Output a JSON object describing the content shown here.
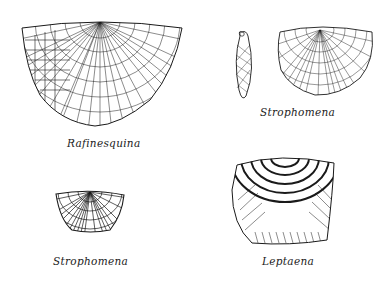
{
  "figures": [
    {
      "id": "rafinesquina",
      "label": "Rafinesquina"
    },
    {
      "id": "strophomena-top",
      "label": "Strophomena"
    },
    {
      "id": "strophomena-bottom",
      "label": "Strophomena"
    },
    {
      "id": "leptaena",
      "label": "Leptaena"
    }
  ],
  "colors": {
    "ink": "#1a1a1a",
    "background": "#ffffff"
  }
}
